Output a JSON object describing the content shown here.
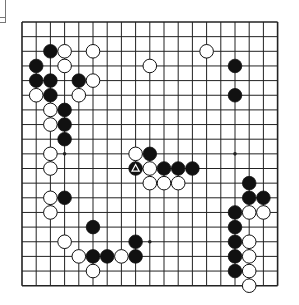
{
  "board": {
    "size": 19,
    "origin_x": 22,
    "origin_y": 22,
    "step_x": 14.2,
    "step_y": 14.65,
    "line_color": "#222222",
    "background": "#ffffff",
    "star_points": [
      [
        3,
        3
      ],
      [
        3,
        9
      ],
      [
        3,
        15
      ],
      [
        9,
        3
      ],
      [
        9,
        9
      ],
      [
        9,
        15
      ],
      [
        15,
        3
      ],
      [
        15,
        9
      ],
      [
        15,
        15
      ]
    ],
    "stones": [
      {
        "color": "black",
        "col": 2,
        "row": 2
      },
      {
        "color": "white",
        "col": 3,
        "row": 2
      },
      {
        "color": "white",
        "col": 5,
        "row": 2
      },
      {
        "color": "white",
        "col": 13,
        "row": 2
      },
      {
        "color": "black",
        "col": 1,
        "row": 3
      },
      {
        "color": "white",
        "col": 3,
        "row": 3
      },
      {
        "color": "white",
        "col": 9,
        "row": 3
      },
      {
        "color": "black",
        "col": 15,
        "row": 3
      },
      {
        "color": "black",
        "col": 1,
        "row": 4
      },
      {
        "color": "black",
        "col": 2,
        "row": 4
      },
      {
        "color": "black",
        "col": 4,
        "row": 4
      },
      {
        "color": "white",
        "col": 5,
        "row": 4
      },
      {
        "color": "white",
        "col": 1,
        "row": 5
      },
      {
        "color": "black",
        "col": 2,
        "row": 5
      },
      {
        "color": "white",
        "col": 4,
        "row": 5
      },
      {
        "color": "black",
        "col": 15,
        "row": 5
      },
      {
        "color": "white",
        "col": 2,
        "row": 6
      },
      {
        "color": "black",
        "col": 3,
        "row": 6
      },
      {
        "color": "white",
        "col": 2,
        "row": 7
      },
      {
        "color": "black",
        "col": 3,
        "row": 7
      },
      {
        "color": "black",
        "col": 3,
        "row": 8
      },
      {
        "color": "white",
        "col": 2,
        "row": 9
      },
      {
        "color": "white",
        "col": 8,
        "row": 9
      },
      {
        "color": "black",
        "col": 9,
        "row": 9
      },
      {
        "color": "white",
        "col": 2,
        "row": 10
      },
      {
        "color": "black",
        "col": 8,
        "row": 10,
        "marker": "triangle"
      },
      {
        "color": "white",
        "col": 9,
        "row": 10
      },
      {
        "color": "black",
        "col": 10,
        "row": 10
      },
      {
        "color": "black",
        "col": 11,
        "row": 10
      },
      {
        "color": "black",
        "col": 12,
        "row": 10
      },
      {
        "color": "white",
        "col": 9,
        "row": 11
      },
      {
        "color": "white",
        "col": 10,
        "row": 11
      },
      {
        "color": "white",
        "col": 11,
        "row": 11
      },
      {
        "color": "black",
        "col": 16,
        "row": 11
      },
      {
        "color": "white",
        "col": 2,
        "row": 12
      },
      {
        "color": "black",
        "col": 3,
        "row": 12
      },
      {
        "color": "black",
        "col": 16,
        "row": 12
      },
      {
        "color": "black",
        "col": 17,
        "row": 12
      },
      {
        "color": "white",
        "col": 2,
        "row": 13
      },
      {
        "color": "black",
        "col": 15,
        "row": 13
      },
      {
        "color": "white",
        "col": 16,
        "row": 13
      },
      {
        "color": "white",
        "col": 17,
        "row": 13
      },
      {
        "color": "black",
        "col": 5,
        "row": 14
      },
      {
        "color": "black",
        "col": 15,
        "row": 14
      },
      {
        "color": "white",
        "col": 3,
        "row": 15
      },
      {
        "color": "black",
        "col": 8,
        "row": 15
      },
      {
        "color": "black",
        "col": 15,
        "row": 15
      },
      {
        "color": "white",
        "col": 16,
        "row": 15
      },
      {
        "color": "white",
        "col": 4,
        "row": 16
      },
      {
        "color": "black",
        "col": 5,
        "row": 16
      },
      {
        "color": "black",
        "col": 6,
        "row": 16
      },
      {
        "color": "white",
        "col": 7,
        "row": 16
      },
      {
        "color": "black",
        "col": 8,
        "row": 16
      },
      {
        "color": "black",
        "col": 15,
        "row": 16
      },
      {
        "color": "white",
        "col": 16,
        "row": 16
      },
      {
        "color": "white",
        "col": 5,
        "row": 17
      },
      {
        "color": "black",
        "col": 15,
        "row": 17
      },
      {
        "color": "white",
        "col": 16,
        "row": 17
      },
      {
        "color": "white",
        "col": 16,
        "row": 18
      }
    ],
    "last_move": {
      "col": 8,
      "row": 10,
      "marker": "triangle"
    }
  }
}
